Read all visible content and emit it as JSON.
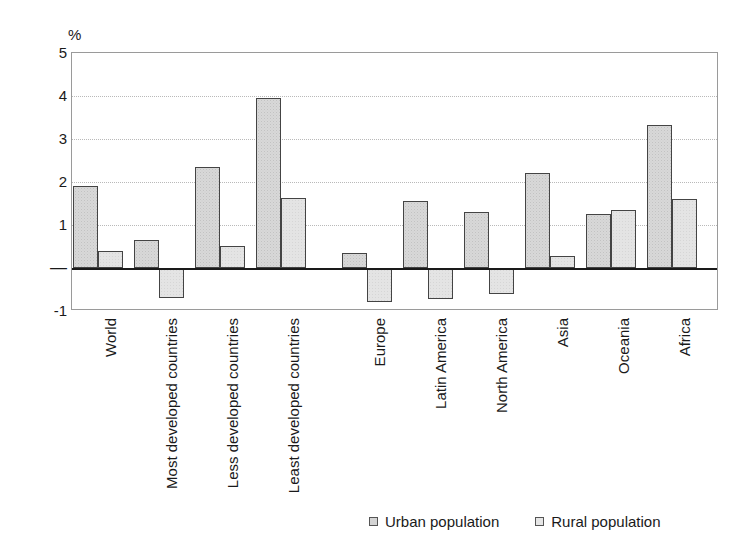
{
  "chart_data": {
    "type": "bar",
    "title": "",
    "subtitle": "",
    "unit_label": "%",
    "xlabel": "",
    "ylabel": "",
    "ylim": [
      -1,
      5
    ],
    "yticks": [
      "5",
      "4",
      "3",
      "2",
      "1",
      "—",
      "-1"
    ],
    "ytick_values": [
      5,
      4,
      3,
      2,
      1,
      0,
      -1
    ],
    "grid": true,
    "gridlines_at": [
      4,
      3,
      2,
      1
    ],
    "legend_position": "bottom-right",
    "group_gap_after": [
      "Least developed countries"
    ],
    "categories": [
      "World",
      "Most developed countries",
      "Less developed countries",
      "Least developed countries",
      "Europe",
      "Latin America",
      "North America",
      "Asia",
      "Oceania",
      "Africa"
    ],
    "series": [
      {
        "name": "Urban population",
        "color": "#d8d8d8",
        "values": [
          1.9,
          0.65,
          2.35,
          3.95,
          0.35,
          1.55,
          1.3,
          2.2,
          1.25,
          3.33
        ]
      },
      {
        "name": "Rural population",
        "color": "#e4e4e4",
        "values": [
          0.4,
          -0.7,
          0.52,
          1.62,
          -0.8,
          -0.72,
          -0.6,
          0.28,
          1.35,
          1.6
        ]
      }
    ]
  },
  "legend": {
    "items": [
      {
        "label": "Urban population",
        "marker": "square-swatch-urban"
      },
      {
        "label": "Rural population",
        "marker": "square-swatch-rural"
      }
    ]
  }
}
